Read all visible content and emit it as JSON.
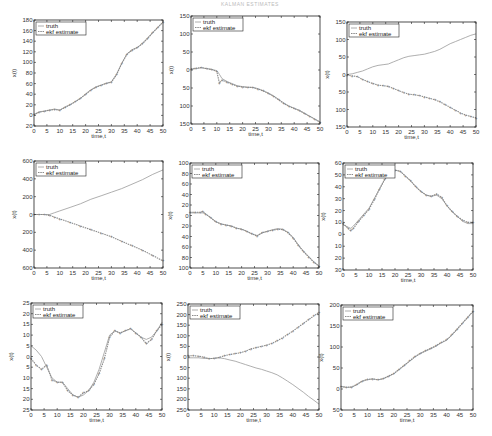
{
  "page": {
    "header_text": "KALMAN ESTIMATES"
  },
  "legend": {
    "truth": "truth",
    "ekf": "ekf estimate"
  },
  "colors": {
    "truth": "#9a9a9a",
    "ekf": "#8a8a8a",
    "axis": "#222222"
  },
  "chart_data": [
    {
      "type": "line",
      "title": "",
      "xlabel": "time,t",
      "ylabel": "x(t)",
      "xlim": [
        0,
        50
      ],
      "ylim": [
        -20,
        180
      ],
      "xticks": [
        0,
        5,
        10,
        15,
        20,
        25,
        30,
        35,
        40,
        45,
        50
      ],
      "yticks": [
        -20,
        0,
        20,
        40,
        60,
        80,
        100,
        120,
        140,
        160,
        180
      ],
      "ytick_labels": [
        "20",
        "0",
        "20",
        "40",
        "60",
        "80",
        "100",
        "120",
        "140",
        "160",
        "180"
      ],
      "box": {
        "x": 34,
        "y": 20,
        "w": 129,
        "h": 106
      },
      "x": [
        0,
        2,
        4,
        6,
        8,
        10,
        12,
        14,
        16,
        18,
        20,
        22,
        24,
        26,
        28,
        30,
        32,
        34,
        36,
        38,
        40,
        42,
        44,
        46,
        48,
        50
      ],
      "series": [
        {
          "name": "truth",
          "values": [
            2,
            7,
            8,
            10,
            12,
            10,
            16,
            20,
            26,
            32,
            40,
            48,
            54,
            57,
            61,
            63,
            78,
            98,
            116,
            124,
            128,
            136,
            146,
            156,
            166,
            176
          ]
        },
        {
          "name": "ekf estimate",
          "values": [
            1,
            6,
            8,
            10,
            11,
            10,
            15,
            20,
            26,
            32,
            40,
            48,
            53,
            57,
            60,
            63,
            77,
            98,
            115,
            123,
            128,
            135,
            145,
            156,
            166,
            176
          ]
        }
      ]
    },
    {
      "type": "line",
      "title": "",
      "xlabel": "time,t",
      "ylabel": "x(t)",
      "xlim": [
        0,
        50
      ],
      "ylim": [
        -150,
        150
      ],
      "xticks": [
        0,
        5,
        10,
        15,
        20,
        25,
        30,
        35,
        40,
        45,
        50
      ],
      "yticks": [
        -150,
        -100,
        -50,
        0,
        50,
        100,
        150
      ],
      "ytick_labels": [
        "150",
        "100",
        "50",
        "0",
        "50",
        "100",
        "150"
      ],
      "box": {
        "x": 191,
        "y": 16,
        "w": 129,
        "h": 108
      },
      "x": [
        0,
        2,
        4,
        6,
        8,
        10,
        11,
        12,
        14,
        16,
        18,
        20,
        22,
        24,
        26,
        28,
        30,
        32,
        34,
        36,
        38,
        40,
        42,
        44,
        46,
        48,
        50
      ],
      "series": [
        {
          "name": "truth",
          "values": [
            2,
            4,
            6,
            4,
            2,
            -2,
            -12,
            -24,
            -32,
            -38,
            -44,
            -46,
            -48,
            -48,
            -52,
            -58,
            -64,
            -72,
            -82,
            -92,
            -100,
            -106,
            -112,
            -120,
            -128,
            -136,
            -144
          ]
        },
        {
          "name": "ekf estimate",
          "values": [
            3,
            5,
            7,
            4,
            1,
            -4,
            -36,
            -28,
            -34,
            -40,
            -45,
            -47,
            -48,
            -49,
            -53,
            -58,
            -65,
            -73,
            -83,
            -93,
            -101,
            -107,
            -113,
            -121,
            -129,
            -137,
            -145
          ]
        }
      ]
    },
    {
      "type": "line",
      "title": "",
      "xlabel": "time,t",
      "ylabel": "x(t)",
      "xlim": [
        0,
        50
      ],
      "ylim": [
        -150,
        150
      ],
      "xticks": [
        0,
        5,
        10,
        15,
        20,
        25,
        30,
        35,
        40,
        45,
        50
      ],
      "yticks": [
        -150,
        -100,
        -50,
        0,
        50,
        100,
        150
      ],
      "ytick_labels": [
        "150",
        "100",
        "50",
        "0",
        "50",
        "100",
        "150"
      ],
      "box": {
        "x": 347,
        "y": 22,
        "w": 129,
        "h": 105
      },
      "x": [
        0,
        2,
        4,
        6,
        8,
        10,
        12,
        14,
        16,
        18,
        20,
        22,
        24,
        26,
        28,
        30,
        32,
        34,
        36,
        38,
        40,
        42,
        44,
        46,
        48,
        50
      ],
      "series": [
        {
          "name": "truth",
          "values": [
            0,
            2,
            6,
            10,
            16,
            22,
            26,
            28,
            30,
            36,
            42,
            48,
            52,
            54,
            56,
            58,
            62,
            66,
            72,
            80,
            88,
            94,
            100,
            106,
            112,
            116
          ]
        },
        {
          "name": "ekf estimate",
          "values": [
            -2,
            -4,
            -6,
            -14,
            -20,
            -26,
            -30,
            -32,
            -34,
            -40,
            -46,
            -52,
            -56,
            -58,
            -60,
            -64,
            -68,
            -72,
            -78,
            -86,
            -94,
            -102,
            -110,
            -116,
            -120,
            -124
          ]
        }
      ]
    },
    {
      "type": "line",
      "title": "",
      "xlabel": "time,t",
      "ylabel": "x(t)",
      "xlim": [
        0,
        50
      ],
      "ylim": [
        -600,
        600
      ],
      "xticks": [
        0,
        5,
        10,
        15,
        20,
        25,
        30,
        35,
        40,
        45,
        50
      ],
      "yticks": [
        -600,
        -400,
        -200,
        0,
        200,
        400,
        600
      ],
      "ytick_labels": [
        "600",
        "400",
        "200",
        "0",
        "200",
        "400",
        "600"
      ],
      "box": {
        "x": 34,
        "y": 161,
        "w": 129,
        "h": 107
      },
      "x": [
        0,
        2,
        4,
        6,
        8,
        10,
        14,
        18,
        22,
        26,
        30,
        34,
        38,
        42,
        46,
        50
      ],
      "series": [
        {
          "name": "truth",
          "values": [
            0,
            0,
            0,
            0,
            20,
            40,
            80,
            120,
            170,
            210,
            250,
            290,
            340,
            390,
            450,
            500
          ]
        },
        {
          "name": "ekf estimate",
          "values": [
            0,
            0,
            0,
            -10,
            -30,
            -50,
            -90,
            -130,
            -170,
            -210,
            -250,
            -300,
            -350,
            -400,
            -460,
            -520
          ]
        }
      ]
    },
    {
      "type": "line",
      "title": "",
      "xlabel": "time,t",
      "ylabel": "x(t)",
      "xlim": [
        0,
        50
      ],
      "ylim": [
        -100,
        100
      ],
      "xticks": [
        0,
        5,
        10,
        15,
        20,
        25,
        30,
        35,
        40,
        45,
        50
      ],
      "yticks": [
        -100,
        -80,
        -60,
        -40,
        -20,
        0,
        20,
        40,
        60,
        80,
        100
      ],
      "ytick_labels": [
        "100",
        "80",
        "60",
        "40",
        "20",
        "0",
        "20",
        "40",
        "60",
        "80",
        "100"
      ],
      "box": {
        "x": 190,
        "y": 163,
        "w": 129,
        "h": 105
      },
      "x": [
        0,
        2,
        4,
        5,
        6,
        8,
        10,
        12,
        14,
        16,
        18,
        20,
        22,
        24,
        26,
        28,
        30,
        32,
        34,
        36,
        38,
        40,
        42,
        44,
        46,
        48,
        50
      ],
      "series": [
        {
          "name": "truth",
          "values": [
            5,
            5,
            5,
            5,
            3,
            -4,
            -12,
            -16,
            -18,
            -20,
            -24,
            -26,
            -30,
            -35,
            -38,
            -33,
            -30,
            -27,
            -25,
            -26,
            -32,
            -42,
            -56,
            -68,
            -78,
            -88,
            -96
          ]
        },
        {
          "name": "ekf estimate",
          "values": [
            6,
            6,
            6,
            8,
            3,
            -4,
            -12,
            -16,
            -18,
            -20,
            -24,
            -26,
            -30,
            -35,
            -39,
            -33,
            -30,
            -28,
            -26,
            -27,
            -33,
            -43,
            -57,
            -69,
            -79,
            -89,
            -97
          ]
        }
      ]
    },
    {
      "type": "line",
      "title": "",
      "xlabel": "time,t",
      "ylabel": "x(t)",
      "xlim": [
        0,
        50
      ],
      "ylim": [
        -30,
        60
      ],
      "xticks": [
        0,
        5,
        10,
        15,
        20,
        25,
        30,
        35,
        40,
        45,
        50
      ],
      "yticks": [
        -30,
        -20,
        -10,
        0,
        10,
        20,
        30,
        40,
        50,
        60
      ],
      "ytick_labels": [
        "30",
        "20",
        "10",
        "0",
        "10",
        "20",
        "30",
        "40",
        "50",
        "60"
      ],
      "box": {
        "x": 343,
        "y": 163,
        "w": 130,
        "h": 107
      },
      "x": [
        0,
        2,
        3,
        4,
        6,
        8,
        10,
        12,
        14,
        16,
        18,
        20,
        22,
        24,
        26,
        28,
        30,
        32,
        34,
        36,
        38,
        40,
        42,
        44,
        46,
        48,
        50
      ],
      "series": [
        {
          "name": "truth",
          "values": [
            8,
            6,
            5,
            7,
            12,
            17,
            22,
            30,
            38,
            46,
            52,
            54,
            53,
            49,
            45,
            40,
            36,
            33,
            32,
            33,
            30,
            24,
            19,
            15,
            11,
            9,
            9
          ]
        },
        {
          "name": "ekf estimate",
          "values": [
            9,
            5,
            3,
            5,
            11,
            16,
            21,
            29,
            38,
            46,
            52,
            54,
            53,
            49,
            45,
            40,
            36,
            33,
            32,
            34,
            31,
            24,
            19,
            15,
            12,
            10,
            10
          ]
        }
      ]
    },
    {
      "type": "line",
      "title": "",
      "xlabel": "time,t",
      "ylabel": "x(t)",
      "xlim": [
        0,
        50
      ],
      "ylim": [
        -25,
        25
      ],
      "xticks": [
        0,
        5,
        10,
        15,
        20,
        25,
        30,
        35,
        40,
        45,
        50
      ],
      "yticks": [
        -25,
        -20,
        -15,
        -10,
        -5,
        0,
        5,
        10,
        15,
        20,
        25
      ],
      "ytick_labels": [
        "25",
        "20",
        "15",
        "10",
        "5",
        "0",
        "5",
        "10",
        "15",
        "20",
        "25"
      ],
      "box": {
        "x": 31,
        "y": 303,
        "w": 131,
        "h": 107
      },
      "x": [
        0,
        2,
        4,
        6,
        8,
        10,
        12,
        14,
        16,
        18,
        20,
        22,
        24,
        26,
        28,
        30,
        32,
        34,
        36,
        38,
        40,
        42,
        44,
        46,
        48,
        50
      ],
      "series": [
        {
          "name": "truth",
          "values": [
            5,
            3,
            0,
            -5,
            -10,
            -12,
            -12,
            -15,
            -18,
            -19,
            -18,
            -16,
            -12,
            -6,
            2,
            10,
            12,
            11,
            12,
            13,
            11,
            9,
            8,
            9,
            12,
            16
          ]
        },
        {
          "name": "ekf estimate",
          "values": [
            -1,
            -4,
            -6,
            -4,
            -11,
            -12,
            -12,
            -16,
            -18,
            -19,
            -17,
            -16,
            -13,
            -8,
            -1,
            9,
            12,
            11,
            12,
            13,
            11,
            9,
            6,
            8,
            12,
            15
          ]
        }
      ]
    },
    {
      "type": "line",
      "title": "",
      "xlabel": "time,t",
      "ylabel": "x(t)",
      "xlim": [
        0,
        50
      ],
      "ylim": [
        -250,
        250
      ],
      "xticks": [
        0,
        5,
        10,
        15,
        20,
        25,
        30,
        35,
        40,
        45,
        50
      ],
      "yticks": [
        -250,
        -200,
        -150,
        -100,
        -50,
        0,
        50,
        100,
        150,
        200,
        250
      ],
      "ytick_labels": [
        "250",
        "200",
        "150",
        "100",
        "50",
        "0",
        "50",
        "100",
        "150",
        "200",
        "250"
      ],
      "box": {
        "x": 188,
        "y": 304,
        "w": 131,
        "h": 106
      },
      "x": [
        0,
        2,
        4,
        6,
        8,
        10,
        12,
        14,
        16,
        18,
        20,
        22,
        24,
        26,
        28,
        30,
        32,
        34,
        36,
        38,
        40,
        42,
        44,
        46,
        48,
        50
      ],
      "series": [
        {
          "name": "truth",
          "values": [
            -4,
            -4,
            -4,
            -6,
            -8,
            -6,
            -4,
            -8,
            -14,
            -20,
            -28,
            -36,
            -44,
            -52,
            -58,
            -66,
            -74,
            -84,
            -98,
            -114,
            -130,
            -148,
            -166,
            -186,
            -204,
            -222
          ]
        },
        {
          "name": "ekf estimate",
          "values": [
            6,
            6,
            4,
            0,
            -8,
            -6,
            -2,
            6,
            12,
            16,
            20,
            28,
            38,
            44,
            50,
            56,
            64,
            76,
            90,
            106,
            122,
            140,
            158,
            176,
            194,
            210
          ]
        }
      ]
    },
    {
      "type": "line",
      "title": "",
      "xlabel": "time,t",
      "ylabel": "x(t)",
      "xlim": [
        0,
        50
      ],
      "ylim": [
        -50,
        200
      ],
      "xticks": [
        0,
        5,
        10,
        15,
        20,
        25,
        30,
        35,
        40,
        45,
        50
      ],
      "yticks": [
        -50,
        0,
        50,
        100,
        150,
        200
      ],
      "ytick_labels": [
        "50",
        "0",
        "50",
        "100",
        "150",
        "200"
      ],
      "box": {
        "x": 341,
        "y": 305,
        "w": 132,
        "h": 105
      },
      "x": [
        0,
        2,
        4,
        6,
        8,
        10,
        12,
        14,
        16,
        18,
        20,
        22,
        24,
        26,
        28,
        30,
        32,
        34,
        36,
        38,
        40,
        42,
        44,
        46,
        48,
        50
      ],
      "series": [
        {
          "name": "truth",
          "values": [
            6,
            4,
            4,
            10,
            18,
            22,
            24,
            22,
            24,
            30,
            36,
            46,
            56,
            66,
            76,
            84,
            90,
            96,
            102,
            110,
            116,
            128,
            142,
            156,
            170,
            184
          ]
        },
        {
          "name": "ekf estimate",
          "values": [
            6,
            4,
            5,
            11,
            19,
            23,
            24,
            22,
            25,
            31,
            37,
            47,
            57,
            67,
            77,
            85,
            91,
            97,
            103,
            111,
            117,
            129,
            143,
            157,
            171,
            185
          ]
        }
      ]
    }
  ]
}
